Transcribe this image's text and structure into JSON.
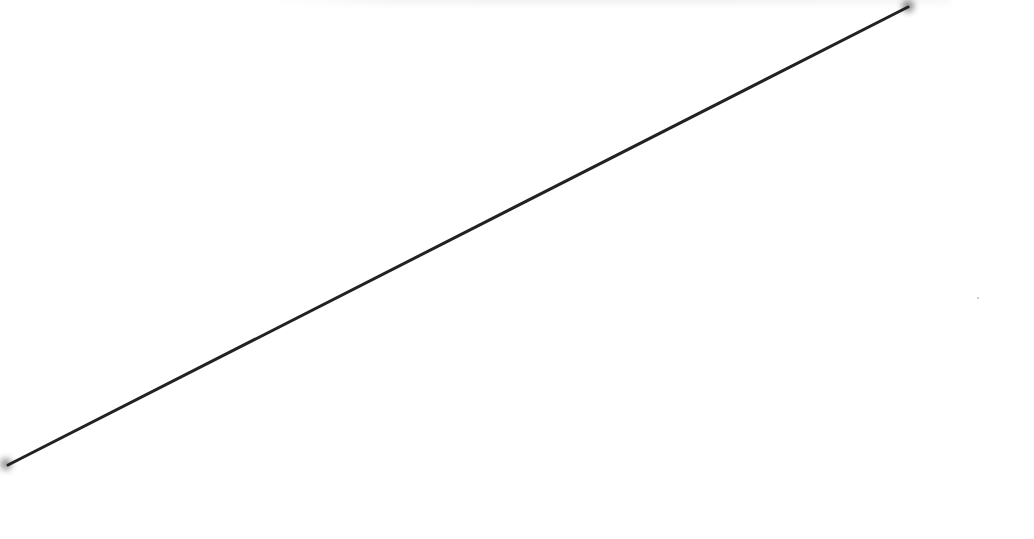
{
  "scene": {
    "background_color": "#ffffff",
    "line": {
      "color": "#222222",
      "stroke_width": 3,
      "start": {
        "x": 8,
        "y": 465
      },
      "end": {
        "x": 908,
        "y": 7
      }
    },
    "endpoint_smudge_color": "#555555",
    "speck": {
      "x": 978,
      "y": 298,
      "color": "#bbbbbb"
    }
  }
}
